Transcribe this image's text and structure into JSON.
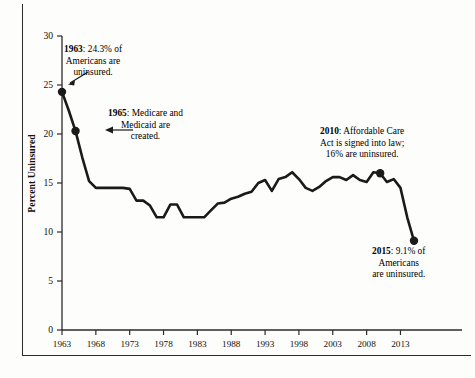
{
  "chart_data": {
    "type": "line",
    "title": "",
    "subtitle": "",
    "xlabel": "",
    "ylabel": "Percent Uninsured",
    "xlim": [
      1963,
      2015
    ],
    "ylim": [
      0,
      30
    ],
    "ytick_values": [
      0,
      5,
      10,
      15,
      20,
      25,
      30
    ],
    "ytick_labels": [
      "0",
      "5",
      "10",
      "15",
      "20",
      "25",
      "30"
    ],
    "xtick_values": [
      1963,
      1968,
      1973,
      1978,
      1983,
      1988,
      1993,
      1998,
      2003,
      2008,
      2013
    ],
    "xtick_labels": [
      "1963",
      "1968",
      "1973",
      "1978",
      "1983",
      "1988",
      "1993",
      "1998",
      "2003",
      "2008",
      "2013"
    ],
    "grid": false,
    "legend": false,
    "line_color": "#1a1a1a",
    "series": [
      {
        "name": "Percent Uninsured",
        "x": [
          1963,
          1964,
          1965,
          1966,
          1967,
          1968,
          1969,
          1970,
          1971,
          1972,
          1973,
          1974,
          1975,
          1976,
          1977,
          1978,
          1979,
          1980,
          1981,
          1982,
          1983,
          1984,
          1985,
          1986,
          1987,
          1988,
          1989,
          1990,
          1991,
          1992,
          1993,
          1994,
          1995,
          1996,
          1997,
          1998,
          1999,
          2000,
          2001,
          2002,
          2003,
          2004,
          2005,
          2006,
          2007,
          2008,
          2009,
          2010,
          2011,
          2012,
          2013,
          2014,
          2015
        ],
        "values": [
          24.3,
          22.4,
          20.3,
          17.6,
          15.2,
          14.5,
          14.5,
          14.5,
          14.5,
          14.5,
          14.4,
          13.2,
          13.2,
          12.7,
          11.5,
          11.5,
          12.8,
          12.8,
          11.5,
          11.5,
          11.5,
          11.5,
          12.2,
          12.9,
          13.0,
          13.4,
          13.6,
          13.9,
          14.1,
          15.0,
          15.3,
          14.2,
          15.4,
          15.6,
          16.1,
          15.4,
          14.5,
          14.2,
          14.6,
          15.2,
          15.6,
          15.6,
          15.3,
          15.8,
          15.3,
          15.1,
          16.1,
          16.0,
          15.1,
          15.4,
          14.5,
          11.5,
          9.1
        ]
      }
    ],
    "markers": [
      {
        "x": 1963,
        "y": 24.3
      },
      {
        "x": 1965,
        "y": 20.3
      },
      {
        "x": 2010,
        "y": 16.0
      },
      {
        "x": 2015,
        "y": 9.1
      }
    ],
    "annotations": [
      {
        "id": "anno-1963",
        "year_label": "1963",
        "text": ": 24.3% of Americans are uninsured.",
        "lines": [
          "1963: 24.3% of",
          "Americans are",
          "uninsured."
        ],
        "bold_prefix": "1963",
        "rest_line1": ": 24.3% of",
        "line2": "Americans are",
        "line3": "uninsured.",
        "has_arrow": true
      },
      {
        "id": "anno-1965",
        "bold_prefix": "1965",
        "rest_line1": ": Medicare and",
        "line2": "Medicaid are",
        "line3": "created.",
        "has_arrow": true
      },
      {
        "id": "anno-2010",
        "bold_prefix": "2010",
        "rest_line1": ": Affordable Care",
        "line2": "Act is signed into law;",
        "line3": "16% are uninsured.",
        "has_arrow": false
      },
      {
        "id": "anno-2015",
        "bold_prefix": "2015",
        "rest_line1": ": 9.1% of",
        "line2": "Americans",
        "line3": "are uninsured.",
        "has_arrow": false
      }
    ]
  }
}
